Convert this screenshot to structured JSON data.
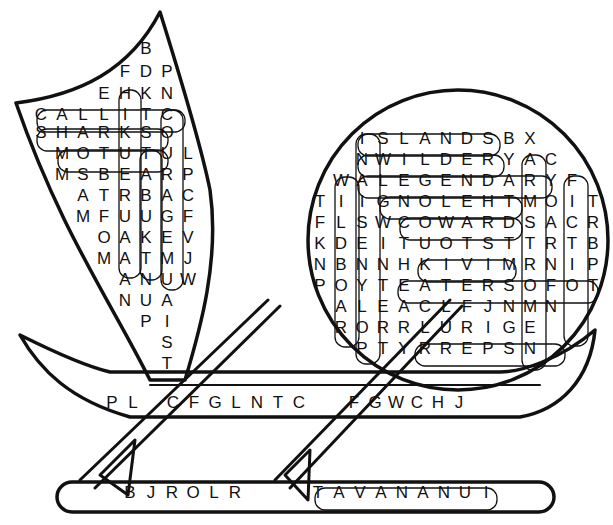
{
  "puzzle": {
    "type": "word search",
    "shape": "outrigger canoe with sail",
    "sail_rows": [
      {
        "y": 48,
        "x0": 146,
        "letters": [
          "B"
        ]
      },
      {
        "y": 71,
        "x0": 125,
        "letters": [
          "F",
          "D",
          "P"
        ]
      },
      {
        "y": 93,
        "x0": 104,
        "letters": [
          "E",
          "H",
          "K",
          "N"
        ]
      },
      {
        "y": 114,
        "x0": 41,
        "letters": [
          "C",
          "A",
          "L",
          "L",
          "I",
          "T",
          "C"
        ]
      },
      {
        "y": 132,
        "x0": 41,
        "letters": [
          "S",
          "H",
          "A",
          "R",
          "K",
          "S",
          "O"
        ]
      },
      {
        "y": 153,
        "x0": 62,
        "letters": [
          "M",
          "O",
          "T",
          "U",
          "T",
          "U",
          "L"
        ]
      },
      {
        "y": 174,
        "x0": 62,
        "letters": [
          "M",
          "S",
          "B",
          "E",
          "A",
          "R",
          "P"
        ]
      },
      {
        "y": 195,
        "x0": 83,
        "letters": [
          "A",
          "T",
          "R",
          "B",
          "A",
          "C"
        ]
      },
      {
        "y": 216,
        "x0": 83,
        "letters": [
          "M",
          "F",
          "U",
          "U",
          "G",
          "F"
        ]
      },
      {
        "y": 237,
        "x0": 104,
        "letters": [
          "O",
          "A",
          "K",
          "E",
          "V"
        ]
      },
      {
        "y": 258,
        "x0": 104,
        "letters": [
          "M",
          "A",
          "T",
          "M",
          "J"
        ]
      },
      {
        "y": 279,
        "x0": 125,
        "letters": [
          "A",
          "N",
          "U",
          "W"
        ]
      },
      {
        "y": 300,
        "x0": 125,
        "letters": [
          "N",
          "U",
          "A"
        ]
      },
      {
        "y": 321,
        "x0": 146,
        "letters": [
          "P",
          "I"
        ]
      },
      {
        "y": 342,
        "x0": 167,
        "letters": [
          "S"
        ]
      },
      {
        "y": 363,
        "x0": 167,
        "letters": [
          "T"
        ]
      }
    ],
    "circle_rows": [
      {
        "y": 138,
        "x0": 362,
        "letters": [
          "I",
          "S",
          "L",
          "A",
          "N",
          "D",
          "S",
          "B",
          "X"
        ]
      },
      {
        "y": 159,
        "x0": 362,
        "letters": [
          "N",
          "W",
          "I",
          "L",
          "D",
          "E",
          "R",
          "Y",
          "A",
          "C"
        ]
      },
      {
        "y": 180,
        "x0": 341,
        "letters": [
          "W",
          "A",
          "L",
          "E",
          "G",
          "E",
          "N",
          "D",
          "A",
          "R",
          "Y",
          "F"
        ]
      },
      {
        "y": 201,
        "x0": 320,
        "letters": [
          "T",
          "I",
          "I",
          "G",
          "N",
          "O",
          "L",
          "E",
          "H",
          "T",
          "M",
          "O",
          "I",
          "T"
        ]
      },
      {
        "y": 222,
        "x0": 320,
        "letters": [
          "F",
          "L",
          "S",
          "W",
          "C",
          "O",
          "W",
          "A",
          "R",
          "D",
          "S",
          "A",
          "C",
          "R"
        ]
      },
      {
        "y": 243,
        "x0": 320,
        "letters": [
          "K",
          "D",
          "E",
          "I",
          "T",
          "U",
          "O",
          "T",
          "S",
          "T",
          "T",
          "R",
          "T",
          "B"
        ]
      },
      {
        "y": 264,
        "x0": 320,
        "letters": [
          "N",
          "B",
          "N",
          "N",
          "H",
          "K",
          "I",
          "V",
          "I",
          "M",
          "R",
          "N",
          "I",
          "P"
        ]
      },
      {
        "y": 285,
        "x0": 320,
        "letters": [
          "P",
          "O",
          "Y",
          "T",
          "E",
          "A",
          "T",
          "E",
          "R",
          "S",
          "O",
          "F",
          "O",
          "T"
        ]
      },
      {
        "y": 306,
        "x0": 341,
        "letters": [
          "A",
          "L",
          "E",
          "A",
          "C",
          "L",
          "F",
          "J",
          "N",
          "M",
          "N"
        ]
      },
      {
        "y": 327,
        "x0": 341,
        "letters": [
          "R",
          "O",
          "R",
          "R",
          "L",
          "U",
          "R",
          "I",
          "G",
          "E"
        ]
      },
      {
        "y": 348,
        "x0": 362,
        "letters": [
          "P",
          "T",
          "Y",
          "R",
          "R",
          "E",
          "P",
          "S",
          "N"
        ]
      }
    ],
    "hull_row": {
      "y": 402,
      "segments": [
        {
          "x0": 112,
          "letters": [
            "P",
            "L"
          ]
        },
        {
          "x0": 173,
          "letters": [
            "C",
            "F",
            "G",
            "L",
            "N",
            "T",
            "C"
          ]
        },
        {
          "x0": 354,
          "letters": [
            "F",
            "G",
            "W",
            "C",
            "H",
            "J"
          ]
        }
      ]
    },
    "float_row": {
      "y": 492,
      "segments": [
        {
          "x0": 130,
          "letters": [
            "B",
            "J",
            "R",
            "O",
            "L",
            "R"
          ]
        },
        {
          "x0": 318,
          "letters": [
            "T",
            "A",
            "V",
            "A",
            "N",
            "A",
            "N",
            "U",
            "I"
          ]
        }
      ]
    },
    "found_words": [
      "CALLIT",
      "SHARKS",
      "MOTU",
      "HIKUERU",
      "TAKUBATS",
      "COURAGE",
      "ISLANDS",
      "WILDER",
      "LEGENDARY",
      "THELONG",
      "COWARDS",
      "KIVI",
      "EATERS",
      "PERRY",
      "WILDBOAR",
      "NAISENYLOP",
      "FICTION",
      "ARMSTRONG",
      "TAVANANUI"
    ]
  },
  "colors": {
    "ink": "#111111",
    "paper": "#ffffff"
  }
}
